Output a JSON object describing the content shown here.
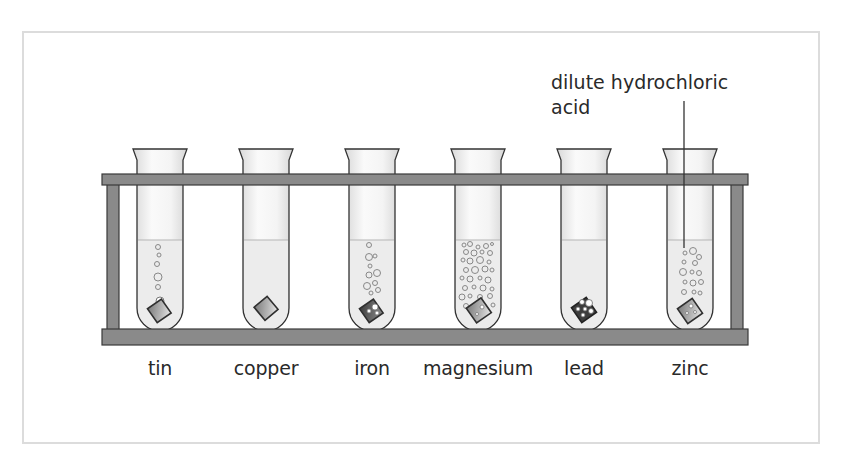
{
  "diagram": {
    "annotation": {
      "line1": "dilute hydrochloric",
      "line2": "acid"
    },
    "tubes": [
      {
        "metal": "tin",
        "reaction": "slow, few bubbles"
      },
      {
        "metal": "copper",
        "reaction": "none"
      },
      {
        "metal": "iron",
        "reaction": "moderate bubbles"
      },
      {
        "metal": "magnesium",
        "reaction": "vigorous, many bubbles"
      },
      {
        "metal": "lead",
        "reaction": "bubbles on surface only"
      },
      {
        "metal": "zinc",
        "reaction": "many bubbles"
      }
    ],
    "colors": {
      "rack": "#8a8a8a",
      "rack_outline": "#3a3a3a",
      "liquid": "#ededed",
      "glass_outline": "#333333",
      "frame_border": "#dcdcdc",
      "text": "#2a2a2a"
    }
  }
}
